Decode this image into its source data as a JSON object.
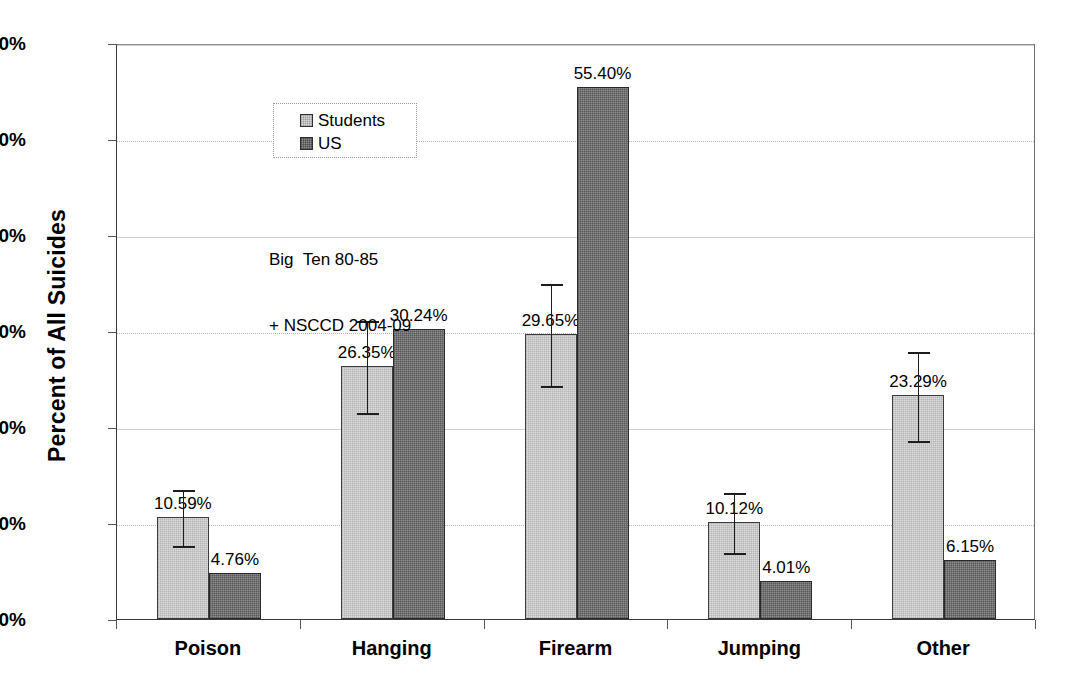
{
  "chart_data": {
    "type": "bar",
    "title": "",
    "xlabel": "",
    "ylabel": "Percent of All Suicides",
    "ylim": [
      0,
      60
    ],
    "ytick_labels": [
      "60%",
      "50%",
      "40%",
      "30%",
      "20%",
      "10%",
      "0%"
    ],
    "ytick_values": [
      60,
      50,
      40,
      30,
      20,
      10,
      0
    ],
    "grid": true,
    "legend_position": "top-left inside plot",
    "categories": [
      "Poison",
      "Hanging",
      "Firearm",
      "Jumping",
      "Other"
    ],
    "series": [
      {
        "name": "Students",
        "color": "#dcdcdc",
        "values": [
          10.59,
          26.35,
          29.65,
          10.12,
          23.29
        ],
        "value_labels": [
          "10.59%",
          "26.35%",
          "29.65%",
          "10.12%",
          "23.29%"
        ],
        "errors": [
          2.9,
          4.8,
          5.3,
          3.1,
          4.6
        ],
        "has_error_bars": true
      },
      {
        "name": "US",
        "color": "#8f8f8f",
        "values": [
          4.76,
          30.24,
          55.4,
          4.01,
          6.15
        ],
        "value_labels": [
          "4.76%",
          "30.24%",
          "55.40%",
          "4.01%",
          "6.15%"
        ],
        "errors": [
          0,
          0,
          0,
          0,
          0
        ],
        "has_error_bars": false
      }
    ],
    "annotations": [
      "Big  Ten 80-85",
      "+ NSCCD 2004-09"
    ]
  },
  "legend": {
    "items": [
      {
        "label": "Students"
      },
      {
        "label": "US"
      }
    ]
  },
  "annotation": {
    "line1": "Big  Ten 80-85",
    "line2": "+ NSCCD 2004-09"
  }
}
